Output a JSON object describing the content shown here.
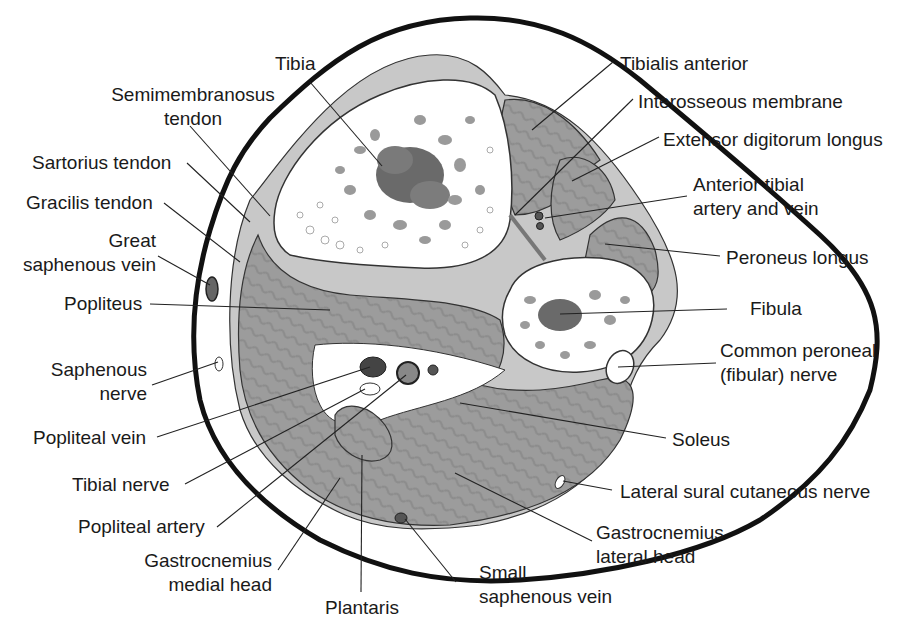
{
  "figure": {
    "colors": {
      "skin_outline": "#111111",
      "muscle_fill": "#9a9a9a",
      "muscle_stripe": "#8a8a8a",
      "bone_fill": "#ffffff",
      "trabecula_dark": "#555555",
      "trabecula_mid": "#8d8d8d",
      "tendon_fill": "#bdbdbd",
      "fat_fill": "#ffffff",
      "leader_line": "#222222"
    }
  },
  "labels": {
    "tibia": "Tibia",
    "semimembranosus": [
      "Semimembranosus",
      "tendon"
    ],
    "sartorius": "Sartorius tendon",
    "gracilis": "Gracilis tendon",
    "great_saphenous": [
      "Great",
      "saphenous vein"
    ],
    "popliteus": "Popliteus",
    "saphenous_nerve": [
      "Saphenous",
      "nerve"
    ],
    "popliteal_vein": "Popliteal vein",
    "tibial_nerve": "Tibial nerve",
    "popliteal_artery": "Popliteal artery",
    "gastroc_medial": [
      "Gastrocnemius",
      "medial head"
    ],
    "plantaris": "Plantaris",
    "small_saphenous": [
      "Small",
      "saphenous vein"
    ],
    "gastroc_lateral": [
      "Gastrocnemius",
      "lateral head"
    ],
    "lateral_sural": "Lateral sural cutaneous nerve",
    "soleus": "Soleus",
    "common_peroneal": [
      "Common peroneal",
      "(fibular) nerve"
    ],
    "fibula": "Fibula",
    "peroneus_longus": "Peroneus longus",
    "anterior_tibial": [
      "Anterior tibial",
      "artery and vein"
    ],
    "extensor_digitorum": "Extensor digitorum longus",
    "interosseous": "Interosseous membrane",
    "tibialis_anterior": "Tibialis anterior"
  }
}
